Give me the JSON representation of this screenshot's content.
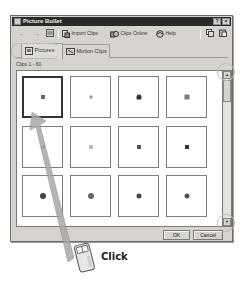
{
  "window": {
    "title": "Picture Bullet",
    "help_button": "?",
    "close_button": "×"
  },
  "toolbar": {
    "back": "back-arrow",
    "forward": "forward-arrow",
    "views": "views-menu",
    "import_clips": "Import Clips",
    "clips_online": "Clips Online",
    "help": "Help",
    "copy": "copy-icon",
    "paste": "paste-icon"
  },
  "tabs": [
    {
      "label": "Pictures",
      "active": true
    },
    {
      "label": "Motion Clips",
      "active": false
    }
  ],
  "clips_label": "Clips 1 - 60",
  "clips": [
    {
      "row": 0,
      "col": 0,
      "shape": "square",
      "color": "#666666",
      "size": 4,
      "selected": true
    },
    {
      "row": 0,
      "col": 1,
      "shape": "square",
      "color": "#999999",
      "size": 3,
      "selected": false
    },
    {
      "row": 0,
      "col": 2,
      "shape": "pin",
      "color": "#333333",
      "size": 5,
      "selected": false
    },
    {
      "row": 0,
      "col": 3,
      "shape": "square",
      "color": "#7a7a7a",
      "size": 5,
      "selected": false
    },
    {
      "row": 1,
      "col": 0,
      "shape": "square",
      "color": "#8a8a8a",
      "size": 4,
      "selected": false
    },
    {
      "row": 1,
      "col": 1,
      "shape": "square",
      "color": "#bbbbbb",
      "size": 4,
      "selected": false
    },
    {
      "row": 1,
      "col": 2,
      "shape": "square",
      "color": "#555555",
      "size": 4,
      "selected": false
    },
    {
      "row": 1,
      "col": 3,
      "shape": "square",
      "color": "#333333",
      "size": 4,
      "selected": false
    },
    {
      "row": 2,
      "col": 0,
      "shape": "circle",
      "color": "#444444",
      "size": 6,
      "selected": false
    },
    {
      "row": 2,
      "col": 1,
      "shape": "circle",
      "color": "#666666",
      "size": 6,
      "selected": false
    },
    {
      "row": 2,
      "col": 2,
      "shape": "circle",
      "color": "#444444",
      "size": 5,
      "selected": false
    },
    {
      "row": 2,
      "col": 3,
      "shape": "circle",
      "color": "#555555",
      "size": 5,
      "selected": false
    }
  ],
  "scrollbar": {
    "up": "▲",
    "down": "▼"
  },
  "buttons": {
    "ok": "OK",
    "cancel": "Cancel"
  },
  "callout": {
    "label": "Click"
  }
}
